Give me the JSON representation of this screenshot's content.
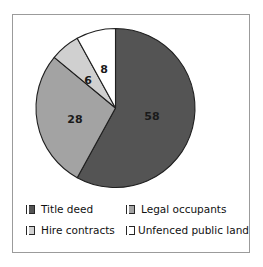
{
  "chart_data": {
    "type": "pie",
    "title": "",
    "categories": [
      "Title deed",
      "Legal occupants",
      "Hire contracts",
      "Unfenced public land"
    ],
    "values": [
      58,
      28,
      6,
      8
    ],
    "labels": [
      "58",
      "28",
      "6",
      "8"
    ],
    "colors": [
      "#545454",
      "#a3a3a3",
      "#d0d0d0",
      "#ffffff"
    ],
    "start_angle_deg": 0,
    "direction": "clockwise",
    "legend_position": "bottom",
    "grid": false,
    "slice_border_color": "#1f1f1f",
    "frame_color": "#9b9b9b",
    "background": "#ffffff"
  },
  "pie": {
    "slices": [
      {
        "name": "Title deed",
        "value": 58,
        "label": "58",
        "color": "#545454",
        "label_x": 152,
        "label_y": 117
      },
      {
        "name": "Legal occupants",
        "value": 28,
        "label": "28",
        "color": "#a3a3a3",
        "label_x": 75,
        "label_y": 120
      },
      {
        "name": "Hire contracts",
        "value": 6,
        "label": "6",
        "color": "#d0d0d0",
        "label_x": 88,
        "label_y": 81
      },
      {
        "name": "Unfenced public land",
        "value": 8,
        "label": "8",
        "color": "#ffffff",
        "label_x": 104,
        "label_y": 70
      }
    ]
  },
  "legend": {
    "rows": [
      {
        "left": {
          "label": "Title deed",
          "color": "#545454"
        },
        "right": {
          "label": "Legal occupants",
          "color": "#a3a3a3"
        }
      },
      {
        "left": {
          "label": "Hire contracts",
          "color": "#d0d0d0"
        },
        "right": {
          "label": "Unfenced public land",
          "color": "#ffffff"
        }
      }
    ]
  }
}
